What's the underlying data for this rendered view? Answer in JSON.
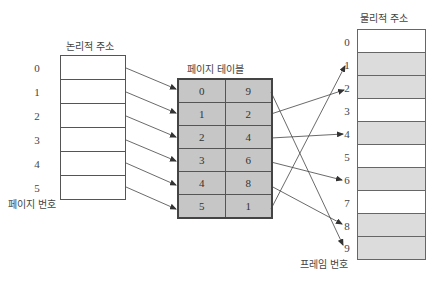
{
  "logical": {
    "title": "논리적 주소",
    "footer_label": "페이지 번호",
    "rows": [
      "0",
      "1",
      "2",
      "3",
      "4",
      "5"
    ]
  },
  "page_table": {
    "title": "페이지 테이블",
    "rows": [
      {
        "page": "0",
        "frame": "9"
      },
      {
        "page": "1",
        "frame": "2"
      },
      {
        "page": "2",
        "frame": "4"
      },
      {
        "page": "3",
        "frame": "6"
      },
      {
        "page": "4",
        "frame": "8"
      },
      {
        "page": "5",
        "frame": "1"
      }
    ]
  },
  "physical": {
    "title": "물리적 주소",
    "footer_label": "프레임 번호",
    "rows": [
      {
        "label": "0",
        "shaded": false
      },
      {
        "label": "1",
        "shaded": true
      },
      {
        "label": "2",
        "shaded": true
      },
      {
        "label": "3",
        "shaded": false
      },
      {
        "label": "4",
        "shaded": true
      },
      {
        "label": "5",
        "shaded": false
      },
      {
        "label": "6",
        "shaded": true
      },
      {
        "label": "7",
        "shaded": false
      },
      {
        "label": "8",
        "shaded": true
      },
      {
        "label": "9",
        "shaded": true
      }
    ]
  },
  "colors": {
    "table_fill": "#c6c6c6",
    "frame_used_fill": "#dcdcdc",
    "line": "#444444"
  }
}
